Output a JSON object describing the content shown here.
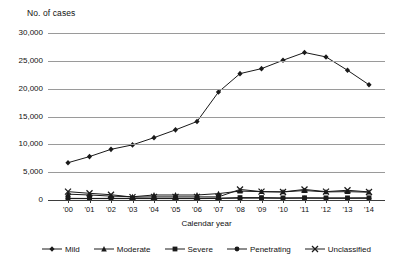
{
  "chart_data": {
    "type": "line",
    "title": "",
    "ylabel": "No. of cases",
    "xlabel": "Calendar year",
    "ylim": [
      0,
      30000
    ],
    "ytick_step": 5000,
    "yticks": [
      "0",
      "5,000",
      "10,000",
      "15,000",
      "20,000",
      "25,000",
      "30,000"
    ],
    "grid": true,
    "legend_position": "bottom",
    "categories": [
      "'00",
      "'01",
      "'02",
      "'03",
      "'04",
      "'05",
      "'06",
      "'07",
      "'08",
      "'09",
      "'10",
      "'11",
      "'12",
      "'13",
      "'14"
    ],
    "series": [
      {
        "name": "Mild",
        "marker": "diamond",
        "values": [
          6700,
          7800,
          9100,
          9900,
          11200,
          12600,
          14100,
          19400,
          22700,
          23600,
          25100,
          26500,
          25700,
          23300,
          20700
        ]
      },
      {
        "name": "Moderate",
        "marker": "triangle",
        "values": [
          1050,
          900,
          700,
          580,
          900,
          900,
          900,
          1150,
          1600,
          1500,
          1450,
          1700,
          1450,
          1500,
          1400
        ]
      },
      {
        "name": "Severe",
        "marker": "square",
        "values": [
          300,
          280,
          300,
          300,
          300,
          300,
          300,
          330,
          430,
          430,
          380,
          400,
          380,
          380,
          400
        ]
      },
      {
        "name": "Penetrating",
        "marker": "circle",
        "values": [
          250,
          250,
          250,
          250,
          250,
          250,
          250,
          280,
          330,
          330,
          300,
          320,
          300,
          300,
          300
        ]
      },
      {
        "name": "Unclassified",
        "marker": "cross",
        "values": [
          1500,
          1200,
          950,
          520,
          560,
          560,
          560,
          560,
          1900,
          1500,
          1450,
          1900,
          1500,
          1750,
          1450
        ]
      }
    ]
  },
  "colors": {
    "line": "#1a1a1a",
    "grid": "#9a9a9a",
    "axis": "#3d3d3d",
    "text": "#111111",
    "background": "#ffffff"
  }
}
